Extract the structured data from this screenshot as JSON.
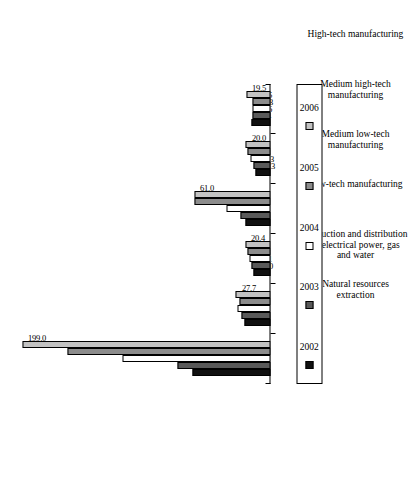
{
  "chart_data": {
    "type": "bar",
    "orientation": "vertical-rotated",
    "title": "",
    "subtitle": "",
    "xlabel": "",
    "ylabel": "",
    "grid": false,
    "legend_position": "bottom",
    "ylim": [
      0,
      210
    ],
    "categories": [
      "Natural resources extraction",
      "Production and distribution of electrical power, gas and water",
      "Low-tech manufacturing",
      "Medium low-tech manufacturing",
      "Medium high-tech manufacturing",
      "High-tech manufacturing"
    ],
    "category_lines": [
      [
        "Natural resources",
        "extraction"
      ],
      [
        "Production and distribution",
        "of electrical power, gas",
        "and water"
      ],
      [
        "Low-tech manufacturing"
      ],
      [
        "Medium low-tech",
        "manufacturing"
      ],
      [
        "Medium high-tech",
        "manufacturing"
      ],
      [
        "High-tech manufacturing"
      ]
    ],
    "series": [
      {
        "name": "2002",
        "color": "#111111",
        "values": [
          62.4,
          21.1,
          14.0,
          20.0,
          12.3,
          15.4
        ],
        "labels": [
          "62.4",
          "21.1",
          "14.0",
          "20.0",
          "12.3",
          "15.4"
        ]
      },
      {
        "name": "2003",
        "color": "#595959",
        "values": [
          74.8,
          22.9,
          15.1,
          24.4,
          13.3,
          14.6
        ],
        "labels": [
          "74.8",
          "22.9",
          "15.1",
          "24.4",
          "13.3",
          "14.6"
        ]
      },
      {
        "name": "2004",
        "color": "#ffffff",
        "values": [
          118.6,
          26.3,
          16.8,
          35.1,
          16.3,
          14.3
        ],
        "labels": [
          "118.6",
          "26.3",
          "16.8",
          "35.1",
          "16.3",
          "14.3"
        ]
      },
      {
        "name": "2005",
        "color": "#8c8c8c",
        "values": [
          162.5,
          24.6,
          18.7,
          60.7,
          18.1,
          14.5
        ],
        "labels": [
          "162.5",
          "24.6",
          "18.7",
          "60.7",
          "18.1",
          "14.5"
        ]
      },
      {
        "name": "2006",
        "color": "#c2c2c2",
        "values": [
          199.0,
          27.7,
          20.4,
          61.0,
          20.0,
          19.5
        ],
        "labels": [
          "199.0",
          "27.7",
          "20.4",
          "61.0",
          "20.0",
          "19.5"
        ]
      }
    ]
  },
  "legend": {
    "items": [
      {
        "label": "2002",
        "color": "#111111"
      },
      {
        "label": "2003",
        "color": "#595959"
      },
      {
        "label": "2004",
        "color": "#ffffff"
      },
      {
        "label": "2005",
        "color": "#8c8c8c"
      },
      {
        "label": "2006",
        "color": "#c2c2c2"
      }
    ]
  }
}
